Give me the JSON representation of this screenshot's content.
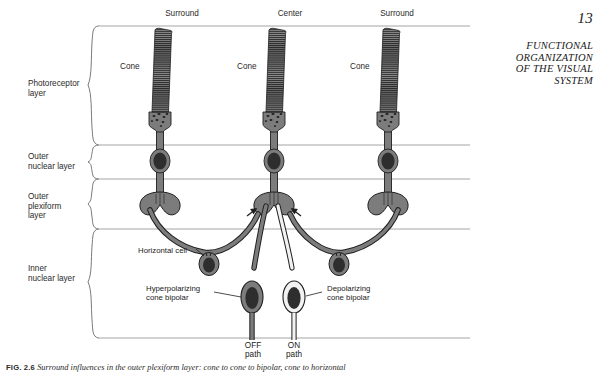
{
  "page": {
    "number": "13",
    "running_head_lines": [
      "FUNCTIONAL",
      "ORGANIZATION",
      "OF THE VISUAL",
      "SYSTEM"
    ]
  },
  "figure": {
    "column_labels": [
      {
        "text": "Surround",
        "x": 182
      },
      {
        "text": "Center",
        "x": 290
      },
      {
        "text": "Surround",
        "x": 397
      }
    ],
    "layer_labels": [
      {
        "lines": [
          "Photoreceptor",
          "layer"
        ],
        "x": 28,
        "y": 79
      },
      {
        "lines": [
          "Outer",
          "nuclear layer"
        ],
        "x": 28,
        "y": 152
      },
      {
        "lines": [
          "Outer",
          "plexiform",
          "layer"
        ],
        "x": 28,
        "y": 199
      },
      {
        "lines": [
          "Inner",
          "nuclear layer"
        ],
        "x": 28,
        "y": 264
      }
    ],
    "cone_labels": [
      {
        "text": "Cone",
        "x": 120,
        "y": 62
      },
      {
        "text": "Cone",
        "x": 237,
        "y": 62
      },
      {
        "text": "Cone",
        "x": 350,
        "y": 62
      }
    ],
    "cell_labels": [
      {
        "lines": [
          "Horizontal cell"
        ],
        "x": 138,
        "y": 246
      },
      {
        "lines": [
          "Hyperpolarizing",
          "cone bipolar"
        ],
        "x": 146,
        "y": 284
      },
      {
        "lines": [
          "Depolarizing",
          "cone bipolar"
        ],
        "x": 327,
        "y": 284
      }
    ],
    "path_labels": [
      {
        "lines": [
          "OFF",
          "path"
        ],
        "x": 253
      },
      {
        "lines": [
          "ON",
          "path"
        ],
        "x": 294
      }
    ],
    "caption": {
      "figure_number": "FIG. 2.6",
      "text": "Surround influences in the outer plexiform layer: cone to cone to bipolar, cone to horizontal"
    }
  },
  "colors": {
    "cell_fill": "#7c7c7c",
    "cell_fill_light": "#f2f2f2",
    "nucleus": "#2e2e2e",
    "outline": "#1f1f1f",
    "rule": "#9a9a9a",
    "brace": "#6b6b6b"
  }
}
